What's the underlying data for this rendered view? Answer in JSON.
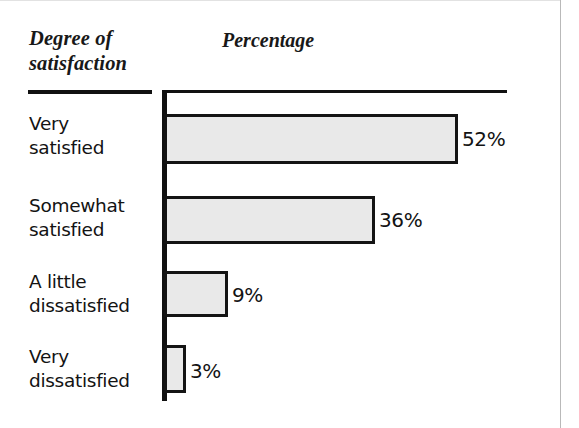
{
  "figure": {
    "background_color": "#ffffff",
    "border_color": "#b9b9b9",
    "ink_color": "#111111"
  },
  "headers": {
    "category_heading_line1": "Degree of",
    "category_heading_line2": "satisfaction",
    "value_heading": "Percentage"
  },
  "chart_data": {
    "type": "bar",
    "orientation": "horizontal",
    "title": "",
    "xlabel": "Percentage",
    "ylabel": "Degree of satisfaction",
    "categories": [
      "Very satisfied",
      "Somewhat satisfied",
      "A little dissatisfied",
      "Very dissatisfied"
    ],
    "values": [
      52,
      36,
      9,
      3
    ],
    "value_labels": [
      "52%",
      "36%",
      "9%",
      "3%"
    ],
    "xlim": [
      0,
      52
    ],
    "grid": false,
    "legend": "none",
    "bar_fill_color": "#e9e9e9",
    "bar_border_color": "#141414"
  },
  "rows": [
    {
      "label_line1": "Very",
      "label_line2": "satisfied",
      "value": 52,
      "value_label": "52%",
      "label_top": 112,
      "bar_top": 114,
      "bar_height": 50,
      "bar_width": 294,
      "value_left": 462,
      "value_top": 129
    },
    {
      "label_line1": "Somewhat",
      "label_line2": "satisfied",
      "value": 36,
      "value_label": "36%",
      "label_top": 194,
      "bar_top": 196,
      "bar_height": 48,
      "bar_width": 211,
      "value_left": 379,
      "value_top": 210
    },
    {
      "label_line1": "A little",
      "label_line2": "dissatisfied",
      "value": 9,
      "value_label": "9%",
      "label_top": 270,
      "bar_top": 271,
      "bar_height": 46,
      "bar_width": 64,
      "value_left": 232,
      "value_top": 285
    },
    {
      "label_line1": "Very",
      "label_line2": "dissatisfied",
      "value": 3,
      "value_label": "3%",
      "label_top": 345,
      "bar_top": 345,
      "bar_height": 48,
      "bar_width": 22,
      "value_left": 190,
      "value_top": 361
    }
  ]
}
